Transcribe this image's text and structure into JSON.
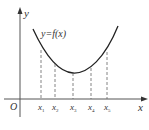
{
  "diagram": {
    "type": "function-graph",
    "curve_label": "y=f(x)",
    "axis_labels": {
      "x": "x",
      "y": "y",
      "origin": "O"
    },
    "points": [
      {
        "name": "x",
        "sub": "1"
      },
      {
        "name": "x",
        "sub": "2"
      },
      {
        "name": "x",
        "sub": "3"
      },
      {
        "name": "x",
        "sub": "4"
      },
      {
        "name": "x",
        "sub": "5"
      }
    ],
    "colors": {
      "axis": "#555555",
      "curve": "#222222",
      "dashed": "#666666"
    }
  }
}
